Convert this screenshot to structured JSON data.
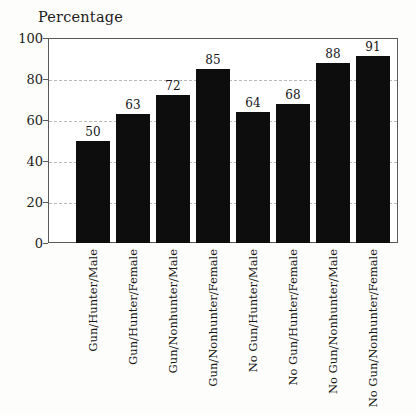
{
  "chart_data": {
    "type": "bar",
    "title": "Percentage",
    "xlabel": "",
    "ylabel": "Percentage",
    "ylim": [
      0,
      100
    ],
    "yticks": [
      0,
      20,
      40,
      60,
      80,
      100
    ],
    "gridlines": [
      20,
      40,
      60,
      80
    ],
    "grid": true,
    "legend": null,
    "bar_color": "#0d0d0d",
    "grid_color": "#b9b9b9",
    "frame_color": "#5a5a5a",
    "background": "#fdfdfb",
    "categories": [
      "Gun/Hunter/Male",
      "Gun/Hunter/Female",
      "Gun/Nonhunter/Male",
      "Gun/Nonhunter/Female",
      "No Gun/Hunter/Male",
      "No Gun/Hunter/Female",
      "No Gun/Nonhunter/Male",
      "No Gun/Nonhunter/Female"
    ],
    "values": [
      50,
      63,
      72,
      85,
      64,
      68,
      88,
      91
    ],
    "value_labels": [
      "50",
      "63",
      "72",
      "85",
      "64",
      "68",
      "88",
      "91"
    ],
    "ytick_labels": [
      "0",
      "20",
      "40",
      "60",
      "80",
      "100"
    ]
  }
}
